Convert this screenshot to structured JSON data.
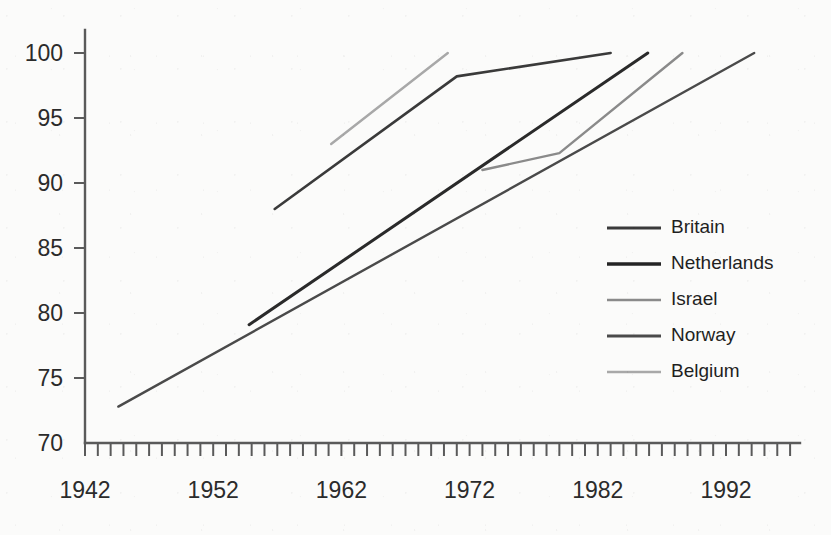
{
  "chart_data": {
    "type": "line",
    "title": "",
    "subtitle": "",
    "xlabel": "",
    "ylabel": "",
    "xlim": [
      1942,
      1996
    ],
    "ylim": [
      70,
      100
    ],
    "grid": false,
    "legend_position": "right-middle",
    "x_ticks_labeled": [
      1942,
      1952,
      1962,
      1972,
      1982,
      1992
    ],
    "x_tick_labels": [
      "1942",
      "1952",
      "1962",
      "1972",
      "1982",
      "1992"
    ],
    "x_minor_tick_interval": 1,
    "y_ticks": [
      70,
      75,
      80,
      85,
      90,
      95,
      100
    ],
    "y_tick_labels": [
      "70",
      "75",
      "80",
      "85",
      "90",
      "95",
      "100"
    ],
    "series": [
      {
        "name": "Britain",
        "color": "#3a3a3a",
        "width": 2.6,
        "points": [
          [
            1956.8,
            88.0
          ],
          [
            1971.0,
            98.2
          ],
          [
            1983.0,
            100.0
          ]
        ]
      },
      {
        "name": "Netherlands",
        "color": "#2a2a2a",
        "width": 3.0,
        "points": [
          [
            1954.8,
            79.1
          ],
          [
            1985.9,
            100.0
          ]
        ]
      },
      {
        "name": "Israel",
        "color": "#8a8a8a",
        "width": 2.4,
        "points": [
          [
            1973.0,
            91.0
          ],
          [
            1979.0,
            92.3
          ],
          [
            1988.6,
            100.0
          ]
        ]
      },
      {
        "name": "Norway",
        "color": "#4a4a4a",
        "width": 2.4,
        "points": [
          [
            1944.6,
            72.8
          ],
          [
            1994.2,
            100.0
          ]
        ]
      },
      {
        "name": "Belgium",
        "color": "#a8a8a8",
        "width": 2.4,
        "points": [
          [
            1961.2,
            93.0
          ],
          [
            1970.3,
            100.0
          ]
        ]
      }
    ]
  },
  "legend": {
    "items": [
      {
        "label": "Britain",
        "color": "#3a3a3a",
        "width": 3.0
      },
      {
        "label": "Netherlands",
        "color": "#242424",
        "width": 3.6
      },
      {
        "label": "Israel",
        "color": "#8a8a8a",
        "width": 2.4
      },
      {
        "label": "Norway",
        "color": "#4a4a4a",
        "width": 3.0
      },
      {
        "label": "Belgium",
        "color": "#a8a8a8",
        "width": 2.4
      }
    ]
  },
  "axes": {
    "x_axis_name": "year-axis",
    "y_axis_name": "percent-axis"
  }
}
